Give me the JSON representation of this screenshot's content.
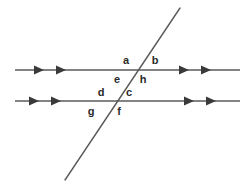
{
  "figure": {
    "background_color": "#ffffff",
    "line_color": "#5a5a5a",
    "label_color": "#2b2b2b",
    "width": 246,
    "height": 185
  },
  "lines": {
    "parallel_top": {
      "name": "upper parallel line",
      "x1": 15,
      "y1": 70,
      "x2": 240,
      "y2": 70,
      "arrow_direction": "right",
      "arrow_count": 4,
      "arrow_positions_x": [
        40,
        62,
        185,
        207
      ]
    },
    "parallel_bottom": {
      "name": "lower parallel line",
      "x1": 15,
      "y1": 101,
      "x2": 240,
      "y2": 101,
      "arrow_direction": "right",
      "arrow_count": 4,
      "arrow_positions_x": [
        35,
        57,
        190,
        212
      ]
    },
    "transversal": {
      "name": "transversal line",
      "x1": 65,
      "y1": 180,
      "x2": 180,
      "y2": 8,
      "arrow_direction": "none",
      "arrow_count": 0
    }
  },
  "intersections": [
    {
      "name": "upper-intersection",
      "x": 136,
      "y": 70
    },
    {
      "name": "lower-intersection",
      "x": 114,
      "y": 101
    }
  ],
  "angle_labels": [
    {
      "id": "a",
      "text": "a",
      "x": 126,
      "y": 60,
      "intersection": "upper-intersection",
      "position": "upper-left"
    },
    {
      "id": "b",
      "text": "b",
      "x": 155,
      "y": 60,
      "intersection": "upper-intersection",
      "position": "upper-right"
    },
    {
      "id": "e",
      "text": "e",
      "x": 117,
      "y": 79,
      "intersection": "upper-intersection",
      "position": "lower-left"
    },
    {
      "id": "h",
      "text": "h",
      "x": 143,
      "y": 79,
      "intersection": "upper-intersection",
      "position": "lower-right"
    },
    {
      "id": "d",
      "text": "d",
      "x": 101,
      "y": 92,
      "intersection": "lower-intersection",
      "position": "upper-left"
    },
    {
      "id": "c",
      "text": "c",
      "x": 129,
      "y": 92,
      "intersection": "lower-intersection",
      "position": "upper-right"
    },
    {
      "id": "g",
      "text": "g",
      "x": 91,
      "y": 111,
      "intersection": "lower-intersection",
      "position": "lower-left"
    },
    {
      "id": "f",
      "text": "f",
      "x": 119,
      "y": 111,
      "intersection": "lower-intersection",
      "position": "lower-right"
    }
  ]
}
